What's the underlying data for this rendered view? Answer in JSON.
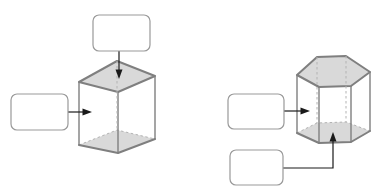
{
  "page": {
    "background": "#ffffff"
  },
  "colors": {
    "page_bg": "#ffffff",
    "face_fill": "#d9d9d9",
    "edge": "#7f7f7f",
    "hidden_edge": "#b3b3b3",
    "box_fill": "#ffffff",
    "box_border": "#999999",
    "connector": "#1a1a1a"
  },
  "diagram": {
    "shapes": [
      {
        "id": "cube",
        "type": "cube",
        "shaded_faces": [
          "top",
          "bottom"
        ],
        "hidden_edges": "dashed"
      },
      {
        "id": "hexagonal-prism",
        "type": "hexagonal prism",
        "shaded_faces": [
          "top",
          "bottom"
        ],
        "hidden_edges": "dashed"
      }
    ],
    "callouts": [
      {
        "id": "cube-top-callout",
        "label": "",
        "points_to": "cube top face",
        "arrow": "down"
      },
      {
        "id": "cube-side-callout",
        "label": "",
        "points_to": "cube left side face",
        "arrow": "right"
      },
      {
        "id": "prism-side-callout",
        "label": "",
        "points_to": "hexagonal prism side face",
        "arrow": "right"
      },
      {
        "id": "prism-bottom-callout",
        "label": "",
        "points_to": "hexagonal prism bottom face",
        "arrow": "elbow-up"
      }
    ]
  }
}
